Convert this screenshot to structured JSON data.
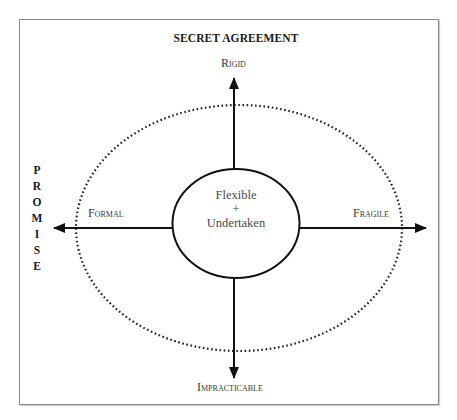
{
  "diagram": {
    "title": "SECRET AGREEMENT",
    "vertical_label": {
      "text": "PROMISE",
      "letters": [
        "P",
        "R",
        "O",
        "M",
        "I",
        "S",
        "E"
      ]
    },
    "axes": {
      "top": "Rigid",
      "left": "Formal",
      "right": "Fragile",
      "bottom": "Impracticable"
    },
    "center": {
      "line1": "Flexible",
      "line2": "+",
      "line3": "Undertaken"
    },
    "colors": {
      "frame": "#8a8a8a",
      "lines": "#111111",
      "dotted_ellipse": "#222222",
      "text": "#333333",
      "background": "#ffffff"
    }
  }
}
